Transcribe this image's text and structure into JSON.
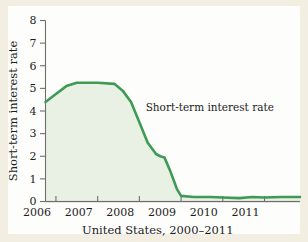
{
  "chart_data": {
    "type": "area",
    "title": "",
    "subtitle": "",
    "xlabel": "United States, 2000–2011",
    "ylabel": "Short-term interest rate",
    "xlim": [
      2005.75,
      2011.85
    ],
    "ylim": [
      0,
      8
    ],
    "grid": false,
    "legend": "none",
    "xticks": [
      2006,
      2007,
      2008,
      2009,
      2010,
      2011
    ],
    "xtick_labels": [
      "2006",
      "2007",
      "2008",
      "2009",
      "2010",
      "2011"
    ],
    "yticks": [
      0,
      1,
      2,
      3,
      4,
      5,
      6,
      7,
      8
    ],
    "ytick_labels": [
      "0",
      "1",
      "2",
      "3",
      "4",
      "5",
      "6",
      "7",
      "8"
    ],
    "annotations": [
      {
        "text": "Short-term interest rate",
        "x": 2008.15,
        "y": 4.0
      }
    ],
    "series": [
      {
        "name": "Short-term interest rate",
        "line_color": "#3f9a56",
        "fill_color": "#e8f1e4",
        "x": [
          2005.75,
          2006.0,
          2006.25,
          2006.5,
          2007.0,
          2007.4,
          2007.6,
          2007.8,
          2008.0,
          2008.2,
          2008.4,
          2008.5,
          2008.6,
          2008.75,
          2008.9,
          2009.0,
          2009.3,
          2009.7,
          2010.0,
          2010.4,
          2010.7,
          2011.0,
          2011.4,
          2011.85
        ],
        "y": [
          4.4,
          4.75,
          5.1,
          5.25,
          5.25,
          5.2,
          4.9,
          4.4,
          3.5,
          2.6,
          2.1,
          2.0,
          1.95,
          1.3,
          0.55,
          0.25,
          0.2,
          0.2,
          0.18,
          0.15,
          0.2,
          0.18,
          0.2,
          0.2
        ]
      }
    ]
  },
  "colors": {
    "page_background": "#f2eee1",
    "panel_background": "#fdfdfb",
    "line": "#3f9a56",
    "area_fill": "#e8f1e4",
    "axis": "#6e6e6e",
    "text": "#1c1c1c"
  }
}
